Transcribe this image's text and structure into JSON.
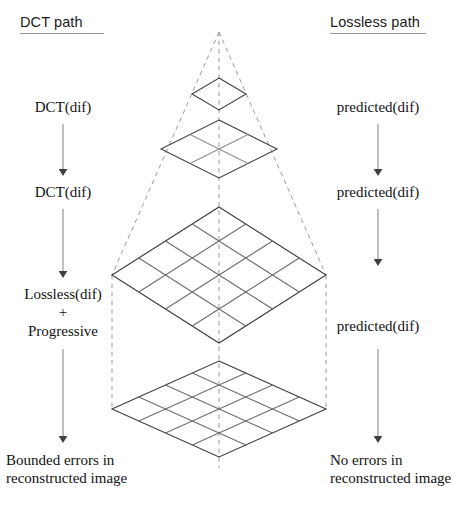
{
  "diagram": {
    "columns": {
      "left": {
        "header": "DCT path",
        "steps": [
          {
            "id": "l1",
            "text": "DCT(dif)"
          },
          {
            "id": "l2",
            "text": "DCT(dif)"
          },
          {
            "id": "l3",
            "line1": "Lossless(dif)",
            "line2": "+",
            "line3": "Progressive"
          },
          {
            "id": "l4",
            "line1": "Bounded errors in",
            "line2": "reconstructed image"
          }
        ]
      },
      "right": {
        "header": "Lossless path",
        "steps": [
          {
            "id": "r1",
            "text": "predicted(dif)"
          },
          {
            "id": "r2",
            "text": "predicted(dif)"
          },
          {
            "id": "r3",
            "text": "predicted(dif)"
          },
          {
            "id": "r4",
            "line1": "No errors in",
            "line2": "reconstructed image"
          }
        ]
      }
    },
    "pyramid": {
      "description": "Multi-resolution pyramid of isometric grid planes stacked under a dashed wireframe cone",
      "apex": {
        "x": 219,
        "y": 32
      },
      "levels": [
        {
          "name": "level-1",
          "grid": "1x1",
          "center_y": 94,
          "half_width": 27,
          "half_height": 16
        },
        {
          "name": "level-2",
          "grid": "2x2",
          "center_y": 149,
          "half_width": 58,
          "half_height": 29
        },
        {
          "name": "level-3",
          "grid": "4x4",
          "center_y": 275,
          "half_width": 107,
          "half_height": 68
        },
        {
          "name": "level-4",
          "grid": "4x4",
          "center_y": 409,
          "half_width": 107,
          "half_height": 48
        }
      ],
      "guides": {
        "axis": "vertical dashed center axis",
        "cone_left": "dashed line apex to left vertex of level-3",
        "cone_right": "dashed line apex to right vertex of level-3",
        "drop_left": "dashed vertical from level-3 left vertex to level-4 left vertex",
        "drop_right": "dashed vertical from level-3 right vertex to level-4 right vertex"
      }
    },
    "colors": {
      "ink": "#121212",
      "grid_line": "#4a4a4a",
      "grid_line_light": "#8f8f8f",
      "dashed_guide": "#9a9a9a",
      "arrow": "#6b6b6b",
      "header_rule": "#9a9a9a",
      "background": "#ffffff"
    },
    "arrows": [
      {
        "id": "arrow-l1",
        "from_y": 124,
        "to_y": 178,
        "x": 63
      },
      {
        "id": "arrow-l2",
        "from_y": 209,
        "to_y": 280,
        "x": 63
      },
      {
        "id": "arrow-l3",
        "from_y": 343,
        "to_y": 445,
        "x": 63
      },
      {
        "id": "arrow-r1",
        "from_y": 124,
        "to_y": 178,
        "x": 378
      },
      {
        "id": "arrow-r2",
        "from_y": 209,
        "to_y": 268,
        "x": 378
      },
      {
        "id": "arrow-r3",
        "from_y": 343,
        "to_y": 445,
        "x": 378
      }
    ]
  }
}
